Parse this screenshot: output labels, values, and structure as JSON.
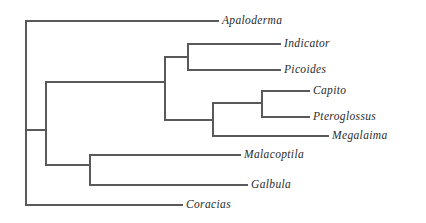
{
  "figure": {
    "type": "phylogenetic-cladogram",
    "orientation": "left-to-right",
    "background_color": "#ffffff",
    "line_color": "#595959",
    "label_color": "#2b2b2b",
    "label_style": "italic-serif"
  },
  "taxa": [
    {
      "name": "Apaloderma",
      "label_x": 222,
      "label_y": 21,
      "tip_x": 218,
      "branch_from_x": 26
    },
    {
      "name": "Indicator",
      "label_x": 284,
      "label_y": 44,
      "tip_x": 280,
      "branch_from_x": 188
    },
    {
      "name": "Picoides",
      "label_x": 284,
      "label_y": 70,
      "tip_x": 280,
      "branch_from_x": 188
    },
    {
      "name": "Capito",
      "label_x": 313,
      "label_y": 91,
      "tip_x": 309,
      "branch_from_x": 262
    },
    {
      "name": "Pteroglossus",
      "label_x": 313,
      "label_y": 117,
      "tip_x": 309,
      "branch_from_x": 262
    },
    {
      "name": "Megalaima",
      "label_x": 332,
      "label_y": 136,
      "tip_x": 328,
      "branch_from_x": 213
    },
    {
      "name": "Malacoptila",
      "label_x": 244,
      "label_y": 155,
      "tip_x": 240,
      "branch_from_x": 90
    },
    {
      "name": "Galbula",
      "label_x": 251,
      "label_y": 185,
      "tip_x": 247,
      "branch_from_x": 90
    },
    {
      "name": "Coracias",
      "label_x": 186,
      "label_y": 205,
      "tip_x": 182,
      "branch_from_x": 26
    }
  ],
  "nodes": [
    {
      "id": "root",
      "x": 26,
      "y_top": 21,
      "y_bottom": 205,
      "parent_x": null,
      "y_attach": null
    },
    {
      "id": "node-a",
      "x": 46,
      "y_top": 82,
      "y_bottom": 165,
      "parent_x": 26,
      "y_attach": 130
    },
    {
      "id": "node-galbuli",
      "x": 90,
      "y_top": 155,
      "y_bottom": 185,
      "parent_x": 46,
      "y_attach": 165
    },
    {
      "id": "node-pici",
      "x": 165,
      "y_top": 57,
      "y_bottom": 120,
      "parent_x": 46,
      "y_attach": 82
    },
    {
      "id": "node-indpic",
      "x": 188,
      "y_top": 44,
      "y_bottom": 70,
      "parent_x": 165,
      "y_attach": 57
    },
    {
      "id": "node-capito",
      "x": 213,
      "y_top": 103,
      "y_bottom": 136,
      "parent_x": 165,
      "y_attach": 120
    },
    {
      "id": "node-ramph",
      "x": 262,
      "y_top": 91,
      "y_bottom": 117,
      "parent_x": 213,
      "y_attach": 103
    }
  ],
  "chart_data": {
    "type": "diagram",
    "diagram_type": "cladogram",
    "title": "",
    "tips": [
      "Apaloderma",
      "Indicator",
      "Picoides",
      "Capito",
      "Pteroglossus",
      "Megalaima",
      "Malacoptila",
      "Galbula",
      "Coracias"
    ],
    "newick": "(Apaloderma,(((Indicator,Picoides),((Capito,Pteroglossus),Megalaima)),(Malacoptila,Galbula)),Coracias);"
  }
}
